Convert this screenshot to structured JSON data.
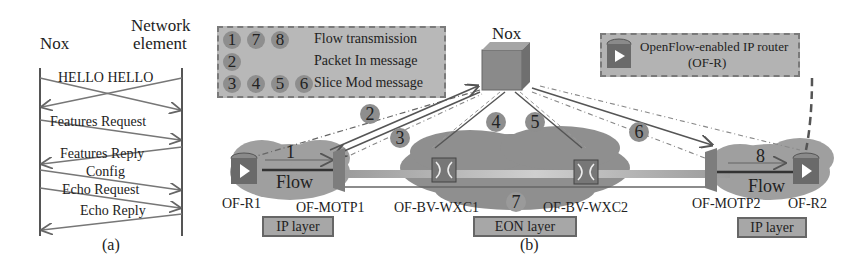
{
  "panel_a": {
    "left_entity": "Nox",
    "right_entity_line1": "Network",
    "right_entity_line2": "element",
    "messages": [
      {
        "label": "HELLO HELLO",
        "direction": "both"
      },
      {
        "label": "Features Request",
        "direction": "to-right"
      },
      {
        "label": "Features Reply",
        "direction": "to-left"
      },
      {
        "label": "Config",
        "direction": "to-right"
      },
      {
        "label": "Echo Request",
        "direction": "to-right"
      },
      {
        "label": "Echo Reply",
        "direction": "to-left"
      }
    ],
    "caption": "(a)"
  },
  "legend": {
    "rows": [
      {
        "badges": [
          "1",
          "7",
          "8"
        ],
        "label": "Flow transmission"
      },
      {
        "badges": [
          "2"
        ],
        "label": "Packet In message"
      },
      {
        "badges": [
          "3",
          "4",
          "5",
          "6"
        ],
        "label": "Slice Mod message"
      }
    ]
  },
  "controller": {
    "label": "Nox"
  },
  "router_legend": {
    "line1": "OpenFlow-enabled IP router",
    "line2": "(OF-R)"
  },
  "nodes": {
    "of_r1": "OF-R1",
    "of_motp1": "OF-MOTP1",
    "of_bv_wxc1": "OF-BV-WXC1",
    "of_bv_wxc2": "OF-BV-WXC2",
    "of_motp2": "OF-MOTP2",
    "of_r2": "OF-R2"
  },
  "flows": {
    "left_flow_label": "Flow",
    "right_flow_label": "Flow"
  },
  "step_numbers": {
    "s1": "1",
    "s2": "2",
    "s3": "3",
    "s4": "4",
    "s5": "5",
    "s6": "6",
    "s7": "7",
    "s8": "8"
  },
  "layers": {
    "left": "IP layer",
    "middle": "EON layer",
    "right": "IP layer"
  },
  "caption_b": "(b)",
  "colors": {
    "cloud": "#9a9a9a",
    "legend_fill": "#b8b8b8",
    "badge": "#8e8e8e",
    "line": "#555555"
  }
}
